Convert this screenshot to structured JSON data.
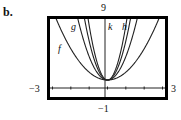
{
  "part_label": "b.",
  "window": {
    "ymax_label": "9",
    "ymin_label": "-1",
    "xmin_label": "−3",
    "xmax_label": "3",
    "ymin_display": "−1"
  },
  "curve_labels": {
    "f": "f",
    "g": "g",
    "h": "h",
    "k": "k"
  },
  "chart_data": {
    "type": "line",
    "title": "",
    "xlabel": "",
    "ylabel": "",
    "xlim": [
      -3,
      3
    ],
    "ylim": [
      -1,
      9
    ],
    "grid": false,
    "x_ticks": [
      -3,
      -2,
      -1,
      0,
      1,
      2,
      3
    ],
    "tick_labels": {
      "xmin": "-3",
      "xmax": "3",
      "ymin": "-1",
      "ymax": "9"
    },
    "legend": "curve labels placed inline on curves",
    "series": [
      {
        "name": "f",
        "formula_approx": "y = x^2 + 1",
        "a": 1,
        "vertex": [
          0,
          1
        ]
      },
      {
        "name": "g",
        "formula_approx": "y = 3x^2 + 1",
        "a": 3,
        "vertex": [
          0,
          1
        ]
      },
      {
        "name": "h",
        "formula_approx": "y = 5x^2 + 1",
        "a": 5,
        "vertex": [
          0,
          1
        ]
      },
      {
        "name": "k",
        "formula_approx": "y = 7x^2 + 1",
        "a": 7,
        "vertex": [
          0,
          1
        ]
      }
    ],
    "x": [
      -3,
      -2.5,
      -2,
      -1.5,
      -1,
      -0.5,
      0,
      0.5,
      1,
      1.5,
      2,
      2.5,
      3
    ]
  }
}
